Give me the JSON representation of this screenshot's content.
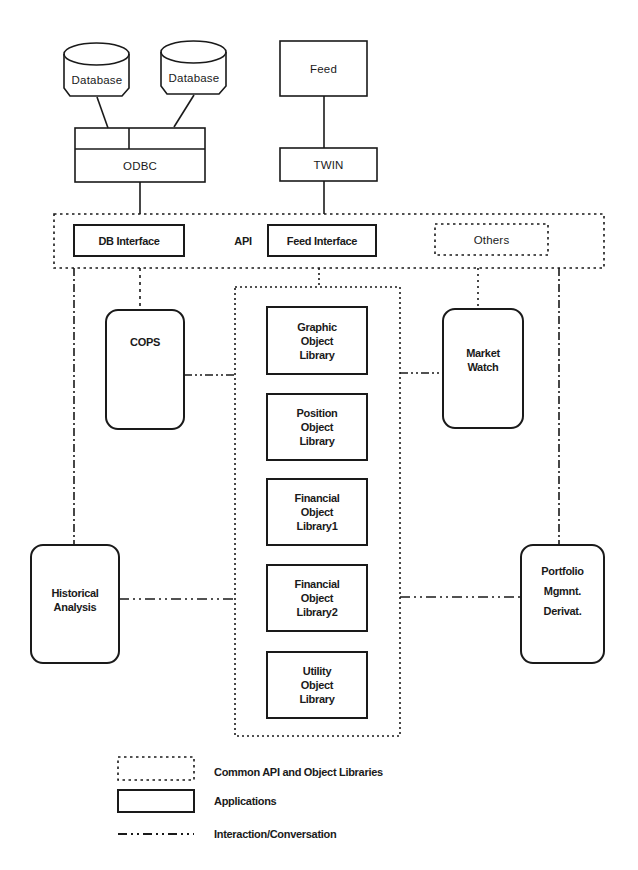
{
  "sources": {
    "database_1": "Database",
    "database_2": "Database",
    "odbc": "ODBC",
    "feed": "Feed",
    "twin": "TWIN"
  },
  "api_layer": {
    "label": "API",
    "db_interface": "DB Interface",
    "feed_interface": "Feed Interface",
    "others": "Others"
  },
  "applications": {
    "cops": "COPS",
    "market_watch": "Market\nWatch",
    "historical_analysis": "Historical\nAnalysis",
    "portfolio": "Portfolio\nMgmnt.\nDerivat."
  },
  "libraries": [
    {
      "label": "Graphic\nObject\nLibrary"
    },
    {
      "label": "Position\nObject\nLibrary"
    },
    {
      "label": "Financial\nObject\nLibrary1"
    },
    {
      "label": "Financial\nObject\nLibrary2"
    },
    {
      "label": "Utility\nObject\nLibrary"
    }
  ],
  "legend": {
    "common": "Common API and Object Libraries",
    "applications": "Applications",
    "interaction": "Interaction/Conversation"
  },
  "colors": {
    "ink": "#1a1a1a",
    "background": "#ffffff"
  }
}
